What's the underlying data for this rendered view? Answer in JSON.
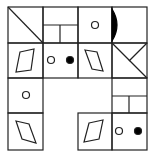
{
  "puzzle": {
    "description": "4x4 grid figure reasoning puzzle with missing cells",
    "grid": {
      "rows": 4,
      "cols": 4,
      "x": [
        8,
        43,
        78,
        112,
        147
      ],
      "y": [
        7,
        43,
        78,
        113,
        150
      ]
    },
    "stroke_color": "#222222",
    "fill_color": "#000000",
    "cells": [
      {
        "row": 0,
        "col": 0,
        "content": "diagonal-line"
      },
      {
        "row": 0,
        "col": 1,
        "content": "split-rectangles"
      },
      {
        "row": 0,
        "col": 2,
        "content": "small-circle"
      },
      {
        "row": 0,
        "col": 3,
        "content": "black-half-circle"
      },
      {
        "row": 1,
        "col": 0,
        "content": "parallelogram"
      },
      {
        "row": 1,
        "col": 1,
        "content": "circle-and-dot"
      },
      {
        "row": 1,
        "col": 2,
        "content": "parallelogram-mirrored"
      },
      {
        "row": 1,
        "col": 3,
        "content": "diagonal-with-branch"
      },
      {
        "row": 2,
        "col": 0,
        "content": "small-circle"
      },
      {
        "row": 2,
        "col": 1,
        "content": "empty-missing"
      },
      {
        "row": 2,
        "col": 2,
        "content": "empty-missing"
      },
      {
        "row": 2,
        "col": 3,
        "content": "split-rectangles"
      },
      {
        "row": 3,
        "col": 0,
        "content": "parallelogram-mirrored"
      },
      {
        "row": 3,
        "col": 1,
        "content": "empty-missing"
      },
      {
        "row": 3,
        "col": 2,
        "content": "parallelogram"
      },
      {
        "row": 3,
        "col": 3,
        "content": "circle-and-dot"
      }
    ]
  }
}
